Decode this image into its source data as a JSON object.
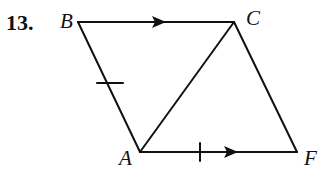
{
  "problem_number": "13.",
  "diagram": {
    "vertices": {
      "B": {
        "label": "B",
        "x": 78,
        "y": 22
      },
      "C": {
        "label": "C",
        "x": 234,
        "y": 22
      },
      "A": {
        "label": "A",
        "x": 140,
        "y": 152
      },
      "F": {
        "label": "F",
        "x": 297,
        "y": 152
      }
    },
    "segments": [
      "BC",
      "CA",
      "BA",
      "CF",
      "AF"
    ],
    "marks": {
      "parallel_arrows": [
        "BC",
        "AF"
      ],
      "congruence_ticks": [
        "BA",
        "AF"
      ]
    },
    "line_color": "#111111"
  }
}
